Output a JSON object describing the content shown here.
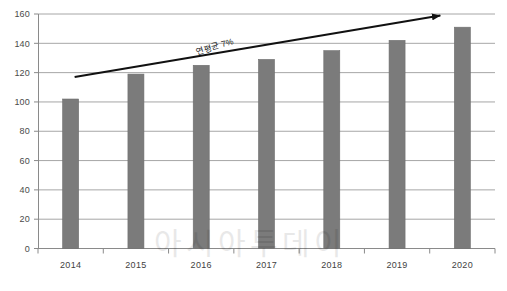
{
  "chart_data": {
    "type": "bar",
    "title": "",
    "subtitle": "",
    "xlabel": "",
    "ylabel": "",
    "categories": [
      "2014",
      "2015",
      "2016",
      "2017",
      "2018",
      "2019",
      "2020"
    ],
    "values": [
      102,
      119,
      125,
      129,
      135,
      142,
      151
    ],
    "series": [
      {
        "name": "",
        "values": [
          102,
          119,
          125,
          129,
          135,
          142,
          151
        ],
        "color": "#7b7b7b"
      }
    ],
    "ylim": [
      0,
      160
    ],
    "xlim": [
      0,
      7
    ],
    "yticks": [
      0,
      20,
      40,
      60,
      80,
      100,
      120,
      140,
      160
    ],
    "ytick_labels": [
      "0",
      "20",
      "40",
      "60",
      "80",
      "100",
      "120",
      "140",
      "160"
    ],
    "xtick_labels": [
      "2014",
      "2015",
      "2016",
      "2017",
      "2018",
      "2019",
      "2020"
    ],
    "grid": true,
    "grid_axis": "y",
    "grid_color": "#9c9c9c",
    "legend": false,
    "legend_position": "none",
    "bar_color": "#7b7b7b",
    "bar_edge_color": "#6e6e6e",
    "axis_color": "#8a8a8a",
    "annotations": [
      {
        "name": "trend-arrow",
        "type": "arrow",
        "label": "연평균 7%",
        "label_rotation_deg": -17,
        "color": "#111111",
        "start_value": 117,
        "end_value": 160,
        "start_category": "2014",
        "end_category": "2020"
      }
    ],
    "watermark": {
      "text": "아시아투데이",
      "color": "#000000",
      "opacity": 0.085
    }
  },
  "figure": {
    "background": "#ffffff",
    "width": 507,
    "height": 291
  },
  "footer": {
    "text": ""
  }
}
